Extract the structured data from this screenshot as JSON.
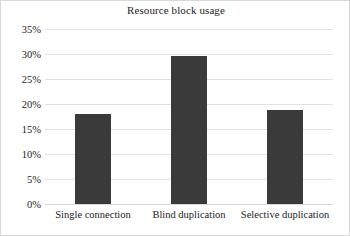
{
  "chart_data": {
    "type": "bar",
    "title": "Resource block usage",
    "xlabel": "",
    "ylabel": "",
    "categories": [
      "Single connection",
      "Blind duplication",
      "Selective duplication"
    ],
    "values": [
      18.0,
      29.6,
      18.8
    ],
    "value_labels": [
      "18.0%",
      "29.6%",
      "18.8%"
    ],
    "ylim": [
      0,
      35
    ],
    "yticks": [
      0,
      5,
      10,
      15,
      20,
      25,
      30,
      35
    ],
    "ytick_labels": [
      "0%",
      "5%",
      "10%",
      "15%",
      "20%",
      "25%",
      "30%",
      "35%"
    ],
    "grid": true,
    "legend": false,
    "legend_position": "none",
    "colors": {
      "bar": "#3a3a3a",
      "gridline": "#e2e2e2",
      "text": "#1d1d1d",
      "border": "#d8d8d8",
      "background": "#ffffff"
    }
  }
}
